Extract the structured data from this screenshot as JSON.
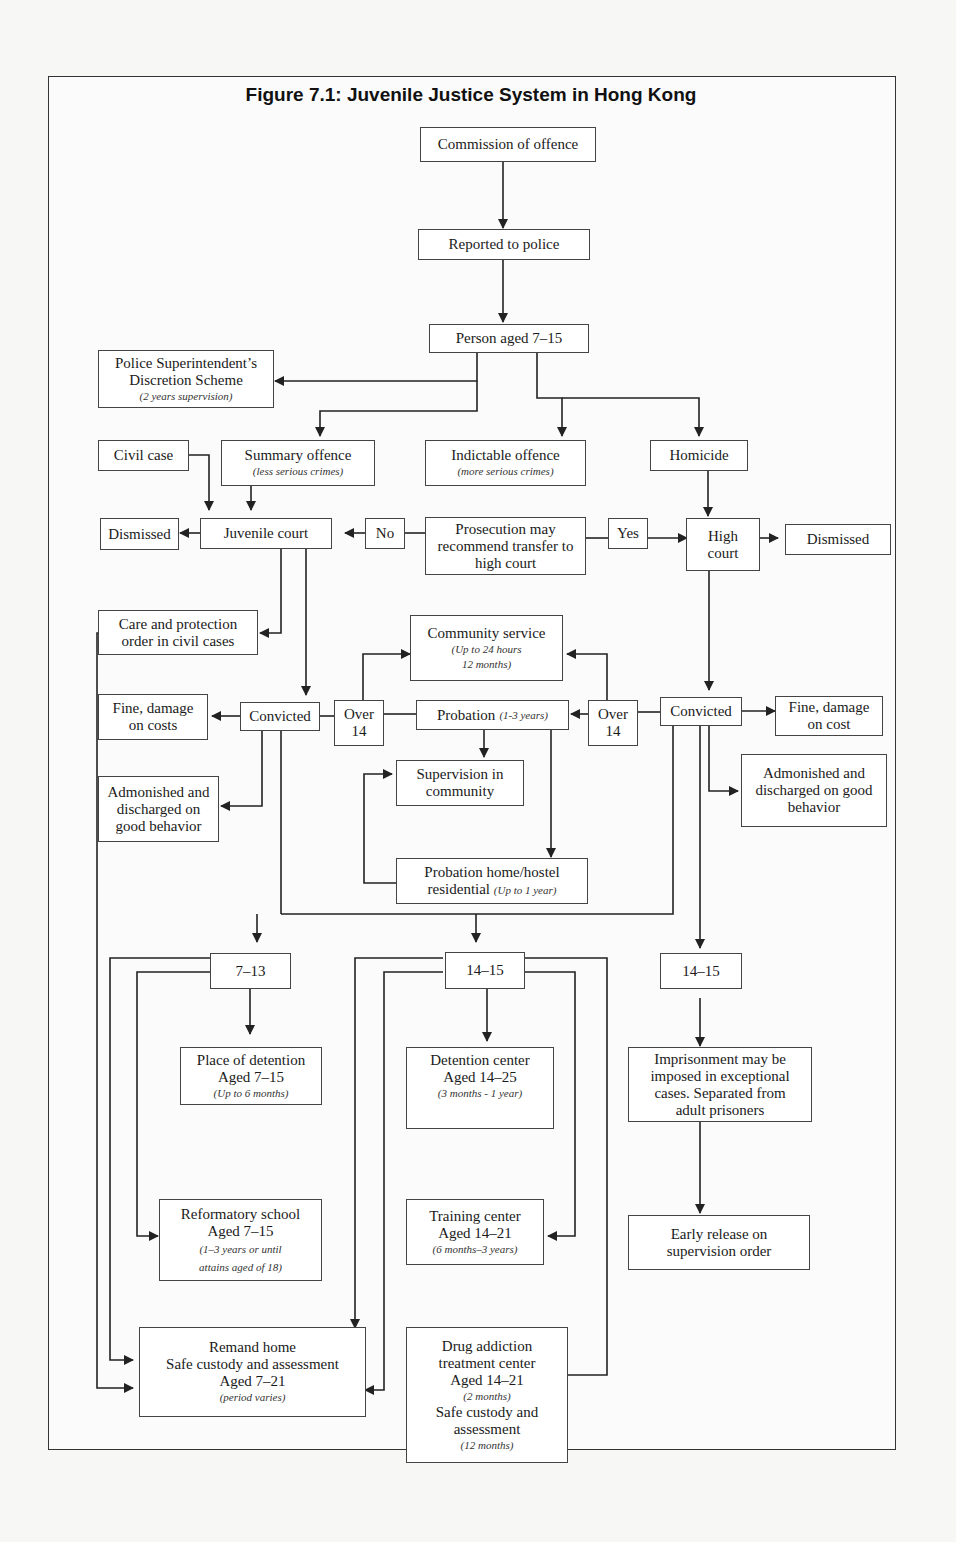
{
  "figure": {
    "title": "Figure 7.1: Juvenile Justice System in Hong Kong"
  },
  "nodes": {
    "commission": {
      "label": "Commission of offence"
    },
    "reported": {
      "label": "Reported to police"
    },
    "person_aged": {
      "label": "Person aged 7–15"
    },
    "psds": {
      "label_1": "Police Superintendent’s",
      "label_2": "Discretion Scheme",
      "sub": "(2 years supervision)"
    },
    "civil_case": {
      "label": "Civil case"
    },
    "summary_offence": {
      "label": "Summary offence",
      "sub": "(less serious crimes)"
    },
    "indictable_offence": {
      "label": "Indictable offence",
      "sub": "(more serious crimes)"
    },
    "homicide": {
      "label": "Homicide"
    },
    "dismissed_left": {
      "label": "Dismissed"
    },
    "juvenile_court": {
      "label": "Juvenile court"
    },
    "no": {
      "label": "No"
    },
    "prosecution": {
      "label": "Prosecution may recommend transfer to high court"
    },
    "yes": {
      "label": "Yes"
    },
    "high_court": {
      "label": "High court"
    },
    "dismissed_right": {
      "label": "Dismissed"
    },
    "care_protection": {
      "label": "Care and protection order in civil cases"
    },
    "community_service": {
      "label": "Community service",
      "sub_1": "(Up to 24 hours",
      "sub_2": "12 months)"
    },
    "fine_left": {
      "label": "Fine, damage on costs"
    },
    "convicted_left": {
      "label": "Convicted"
    },
    "over14_left": {
      "label_1": "Over",
      "label_2": "14"
    },
    "probation": {
      "label": "Probation",
      "sub": "(1-3 years)"
    },
    "over14_right": {
      "label_1": "Over",
      "label_2": "14"
    },
    "convicted_right": {
      "label": "Convicted"
    },
    "fine_right": {
      "label": "Fine, damage on cost"
    },
    "admonished_left": {
      "label": "Admonished and discharged on good behavior"
    },
    "supervision_community": {
      "label": "Supervision in community"
    },
    "admonished_right": {
      "label": "Admonished and discharged on good behavior"
    },
    "probation_home": {
      "label_1": "Probation home/hostel",
      "label_2": "residential",
      "sub": "(Up to 1 year)"
    },
    "age_7_13": {
      "label": "7–13"
    },
    "age_14_15_mid": {
      "label": "14–15"
    },
    "age_14_15_right": {
      "label": "14–15"
    },
    "place_detention": {
      "label_1": "Place of detention",
      "label_2": "Aged 7–15",
      "sub": "(Up to 6 months)"
    },
    "detention_center": {
      "label_1": "Detention center",
      "label_2": "Aged 14–25",
      "sub": "(3 months - 1 year)"
    },
    "imprisonment": {
      "label": "Imprisonment may be imposed in exceptional cases.  Separated from adult prisoners"
    },
    "reformatory": {
      "label_1": "Reformatory school",
      "label_2": "Aged 7–15",
      "sub_1": "(1–3 years or until",
      "sub_2": "attains aged of 18)"
    },
    "training_center": {
      "label_1": "Training center",
      "label_2": "Aged 14–21",
      "sub": "(6 months–3 years)"
    },
    "early_release": {
      "label": "Early release on supervision order"
    },
    "remand_home": {
      "label_1": "Remand home",
      "label_2": "Safe custody and assessment",
      "label_3": "Aged 7–21",
      "sub": "(period varies)"
    },
    "drug_addiction": {
      "label_1": "Drug addiction",
      "label_2": "treatment center",
      "label_3": "Aged 14–21",
      "sub_1": "(2 months)",
      "label_4": "Safe custody and",
      "label_5": "assessment",
      "sub_2": "(12 months)"
    }
  },
  "style": {
    "line_color": "#222222",
    "box_border": "#444444",
    "box_fill": "#ffffff",
    "page_bg": "#f7f7f5"
  }
}
